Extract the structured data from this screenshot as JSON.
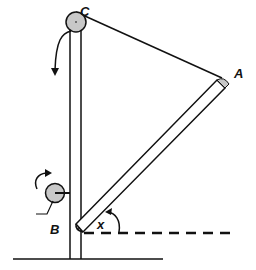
{
  "labels": {
    "pulley_top": "C",
    "rod_tip": "A",
    "rod_pivot": "B",
    "angle": "x"
  },
  "colors": {
    "stroke": "#111111",
    "pulley_fill": "#c8c8c8",
    "background": "#ffffff"
  }
}
